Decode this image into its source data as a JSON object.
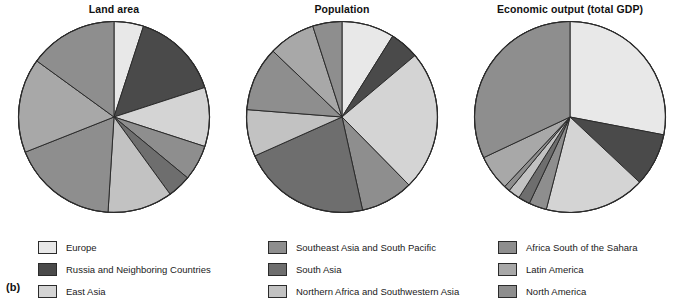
{
  "figure": {
    "label": "(b)"
  },
  "palette": {
    "very_light": "#e8e8e8",
    "light": "#d4d4d4",
    "light_mid": "#c2c2c2",
    "mid": "#a8a8a8",
    "mid_dark": "#8e8e8e",
    "dark": "#6e6e6e",
    "very_dark": "#4a4a4a",
    "stroke": "#2b2b2b"
  },
  "charts": [
    {
      "title": "Land area",
      "chart_data": {
        "type": "pie",
        "title": "Land area",
        "start_angle_deg": 0,
        "direction": "clockwise",
        "legend_position": "below",
        "labels": [
          "Europe",
          "Russia and Neighboring Countries",
          "East Asia",
          "Southeast Asia and South Pacific",
          "South Asia",
          "Northern Africa and Southwestern Asia",
          "Africa South of the Sahara",
          "Latin America",
          "North America"
        ],
        "values": [
          5,
          15,
          10,
          6,
          4,
          11,
          18,
          16,
          15
        ],
        "unit": "percent of world total"
      }
    },
    {
      "title": "Population",
      "chart_data": {
        "type": "pie",
        "title": "Population",
        "start_angle_deg": 0,
        "direction": "clockwise",
        "legend_position": "below",
        "labels": [
          "Europe",
          "Russia and Neighboring Countries",
          "East Asia",
          "Southeast Asia and South Pacific",
          "South Asia",
          "Northern Africa and Southwestern Asia",
          "Africa South of the Sahara",
          "Latin America",
          "North America"
        ],
        "values": [
          9,
          5,
          24,
          9,
          22,
          8,
          11,
          8,
          5
        ],
        "unit": "percent of world total"
      }
    },
    {
      "title": "Economic output (total GDP)",
      "chart_data": {
        "type": "pie",
        "title": "Economic output (total GDP)",
        "start_angle_deg": 0,
        "direction": "clockwise",
        "legend_position": "below",
        "labels": [
          "Europe",
          "Russia and Neighboring Countries",
          "East Asia",
          "Southeast Asia and South Pacific",
          "South Asia",
          "Northern Africa and Southwestern Asia",
          "Africa South of the Sahara",
          "Latin America",
          "North America"
        ],
        "values": [
          28,
          9,
          17,
          3,
          2,
          2,
          1,
          6,
          32
        ],
        "unit": "percent of world total"
      }
    }
  ],
  "legend": {
    "columns": [
      {
        "items": [
          {
            "label": "Europe",
            "color": "#e8e8e8"
          },
          {
            "label": "Russia and Neighboring Countries",
            "color": "#4a4a4a"
          },
          {
            "label": "East Asia",
            "color": "#d4d4d4"
          }
        ]
      },
      {
        "items": [
          {
            "label": "Southeast Asia and South Pacific",
            "color": "#8e8e8e"
          },
          {
            "label": "South Asia",
            "color": "#6e6e6e"
          },
          {
            "label": "Northern Africa and Southwestern Asia",
            "color": "#c2c2c2"
          }
        ]
      },
      {
        "items": [
          {
            "label": "Africa South of the Sahara",
            "color": "#8e8e8e"
          },
          {
            "label": "Latin America",
            "color": "#a8a8a8"
          },
          {
            "label": "North America",
            "color": "#8e8e8e"
          }
        ]
      }
    ]
  }
}
